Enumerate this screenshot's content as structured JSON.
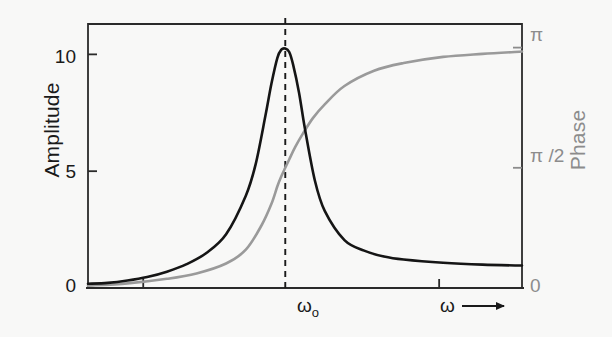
{
  "chart_data": {
    "type": "line",
    "title": "",
    "xlabel": "ω",
    "background": "#f8f8f7",
    "grid": false,
    "legend_position": "none",
    "axes": {
      "x": {
        "label": "ω",
        "arrow": true,
        "range": [
          0,
          2.2
        ],
        "resonance_marker": "ωo",
        "resonance_value": 1.0,
        "tick_positions": [
          0.28,
          1.78
        ],
        "tick_labels": [
          "",
          ""
        ]
      },
      "y_left": {
        "label": "Amplitude",
        "color": "#1a1a1a",
        "ticks": [
          0,
          5,
          10
        ],
        "tick_labels": [
          "0",
          "5",
          "10"
        ],
        "range": [
          0,
          11.3
        ]
      },
      "y_right": {
        "label": "Phase",
        "color": "#8c8c8c",
        "ticks": [
          0,
          1.5707963,
          3.1415927
        ],
        "tick_labels": [
          "0",
          "π /2",
          "π"
        ],
        "range": [
          0,
          3.45
        ]
      }
    },
    "series": [
      {
        "name": "Amplitude",
        "color": "#151515",
        "axis": "left",
        "width": 2.6,
        "model": "lorentzian",
        "params": {
          "peak": 10.25,
          "omega0": 1.0,
          "gamma": 0.1,
          "baseline": 0.18
        },
        "x": [
          0.0,
          0.1,
          0.2,
          0.3,
          0.4,
          0.5,
          0.6,
          0.7,
          0.8,
          0.85,
          0.9,
          0.93,
          0.96,
          0.98,
          1.0,
          1.02,
          1.04,
          1.07,
          1.1,
          1.15,
          1.2,
          1.3,
          1.4,
          1.5,
          1.6,
          1.8,
          2.0,
          2.2
        ],
        "y": [
          0.18,
          0.22,
          0.32,
          0.47,
          0.7,
          1.02,
          1.5,
          2.3,
          3.95,
          5.3,
          7.4,
          8.75,
          9.85,
          10.2,
          10.25,
          10.1,
          9.55,
          8.35,
          6.8,
          4.6,
          3.3,
          2.05,
          1.6,
          1.35,
          1.22,
          1.08,
          1.0,
          0.96
        ]
      },
      {
        "name": "Phase",
        "color": "#9a9a9a",
        "axis": "right",
        "width": 2.6,
        "model": "arctangent",
        "params": {
          "omega0": 1.0,
          "gamma": 0.1
        },
        "x": [
          0.0,
          0.2,
          0.4,
          0.55,
          0.7,
          0.8,
          0.88,
          0.93,
          0.96,
          0.98,
          1.0,
          1.02,
          1.05,
          1.09,
          1.14,
          1.2,
          1.3,
          1.45,
          1.6,
          1.8,
          2.0,
          2.2
        ],
        "y": [
          0.03,
          0.06,
          0.12,
          0.19,
          0.32,
          0.5,
          0.82,
          1.1,
          1.33,
          1.46,
          1.5708,
          1.68,
          1.84,
          2.02,
          2.22,
          2.4,
          2.64,
          2.84,
          2.94,
          3.02,
          3.06,
          3.09
        ]
      }
    ],
    "annotations": [
      {
        "name": "resonance-dashed-line",
        "type": "vline",
        "x": 1.0,
        "style": "dashed",
        "color": "#1a1a1a"
      }
    ]
  },
  "labels": {
    "amplitude_axis": "Amplitude",
    "phase_axis": "Phase",
    "y_left_10": "10",
    "y_left_5": "5",
    "y_left_0": "0",
    "y_right_pi": "π",
    "y_right_pi_half": "π /2",
    "y_right_zero": "0",
    "omega_zero_symbol": "ω",
    "omega_zero_subscript": "o",
    "omega_symbol": "ω"
  }
}
